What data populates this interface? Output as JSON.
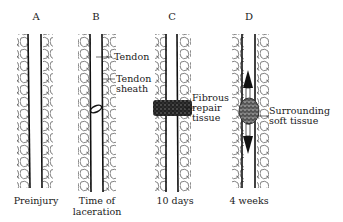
{
  "figure": {
    "panels": [
      {
        "id": "A",
        "letter": "A",
        "caption": "Preinjury"
      },
      {
        "id": "B",
        "letter": "B",
        "caption_line1": "Time of",
        "caption_line2": "laceration"
      },
      {
        "id": "C",
        "letter": "C",
        "caption": "10 days"
      },
      {
        "id": "D",
        "letter": "D",
        "caption": "4 weeks"
      }
    ],
    "annotations": {
      "tendon": "Tendon",
      "tendon_sheath_line1": "Tendon",
      "tendon_sheath_line2": "sheath",
      "fibrous_line1": "Fibrous",
      "fibrous_line2": "repair",
      "fibrous_line3": "tissue",
      "surrounding_line1": "Surrounding",
      "surrounding_line2": "soft tissue"
    },
    "colors": {
      "ink": "#1a1a1a",
      "background": "#ffffff"
    }
  }
}
